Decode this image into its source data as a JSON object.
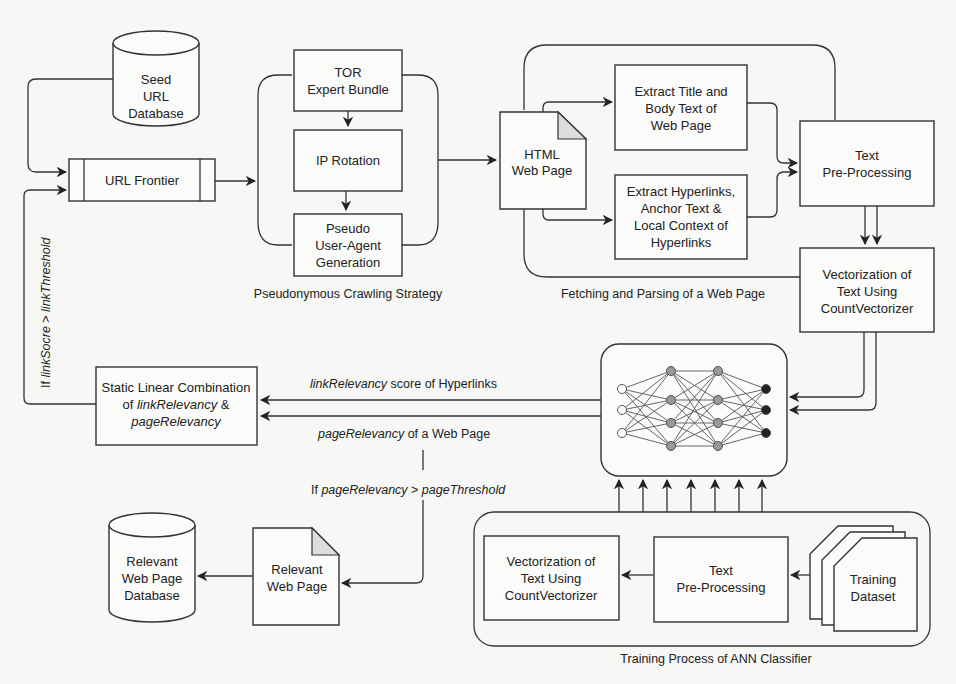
{
  "nodes": {
    "seed_db": {
      "lines": [
        "Seed",
        "URL",
        "Database"
      ]
    },
    "url_frontier": {
      "label": "URL Frontier"
    },
    "tor": {
      "lines": [
        "TOR",
        "Expert Bundle"
      ]
    },
    "ip_rotation": {
      "label": "IP Rotation"
    },
    "pseudo_ua": {
      "lines": [
        "Pseudo",
        "User-Agent",
        "Generation"
      ]
    },
    "html_page": {
      "lines": [
        "HTML",
        "Web Page"
      ]
    },
    "extract_title": {
      "lines": [
        "Extract Title and",
        "Body Text of",
        "Web Page"
      ]
    },
    "extract_links": {
      "lines": [
        "Extract Hyperlinks,",
        "Anchor Text &",
        "Local Context of",
        "Hyperlinks"
      ]
    },
    "text_preproc": {
      "lines": [
        "Text",
        "Pre-Processing"
      ]
    },
    "vectorization": {
      "lines": [
        "Vectorization of",
        "Text Using",
        "CountVectorizer"
      ]
    },
    "static_combo": {
      "line1": "Static Linear Combination",
      "line2_pre": "of ",
      "line2_it": "linkRelevancy",
      "line2_post": " &",
      "line3_it": "pageRelevancy"
    },
    "relevant_page": {
      "lines": [
        "Relevant",
        "Web Page"
      ]
    },
    "relevant_db": {
      "lines": [
        "Relevant",
        "Web Page",
        "Database"
      ]
    },
    "train_vectorization": {
      "lines": [
        "Vectorization of",
        "Text Using",
        "CountVectorizer"
      ]
    },
    "train_preproc": {
      "lines": [
        "Text",
        "Pre-Processing"
      ]
    },
    "training_dataset": {
      "lines": [
        "Training",
        "Dataset"
      ]
    },
    "ann": {
      "icon": "neural-network-icon"
    }
  },
  "groups": {
    "crawling": "Pseudonymous Crawling Strategy",
    "fetching": "Fetching and Parsing of a Web Page",
    "training": "Training Process of ANN Classifier"
  },
  "edges": {
    "link_score": {
      "it": "linkRelevancy",
      "rest": " score of Hyperlinks"
    },
    "page_relevancy": {
      "it": "pageRelevancy",
      "rest": " of a Web Page"
    },
    "page_condition": {
      "pre": "If ",
      "it1": "pageRelevancy",
      "mid": " > ",
      "it2": "pageThreshold"
    },
    "link_condition": {
      "pre": "If ",
      "it1": "linkSocre",
      "mid": " > ",
      "it2": "linkThreshold"
    }
  }
}
